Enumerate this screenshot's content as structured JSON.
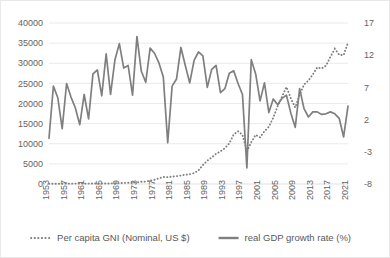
{
  "chart_data": {
    "type": "line",
    "title": "",
    "xlabel": "",
    "grid": true,
    "legend_position": "bottom",
    "x": [
      1953,
      1954,
      1955,
      1956,
      1957,
      1958,
      1959,
      1960,
      1961,
      1962,
      1963,
      1964,
      1965,
      1966,
      1967,
      1968,
      1969,
      1970,
      1971,
      1972,
      1973,
      1974,
      1975,
      1976,
      1977,
      1978,
      1979,
      1980,
      1981,
      1982,
      1983,
      1984,
      1985,
      1986,
      1987,
      1988,
      1989,
      1990,
      1991,
      1992,
      1993,
      1994,
      1995,
      1996,
      1997,
      1998,
      1999,
      2000,
      2001,
      2002,
      2003,
      2004,
      2005,
      2006,
      2007,
      2008,
      2009,
      2010,
      2011,
      2012,
      2013,
      2014,
      2015,
      2016,
      2017,
      2018,
      2019,
      2020,
      2021
    ],
    "xtick_labels": [
      "1953",
      "1957",
      "1961",
      "1965",
      "1969",
      "1973",
      "1977",
      "1981",
      "1985",
      "1989",
      "1993",
      "1997",
      "2001",
      "2005",
      "2009",
      "2013",
      "2017",
      "2021"
    ],
    "xtick_step_years": 4,
    "axes": {
      "left": {
        "label": "Per capita GNI (Nominal, US $)",
        "ylim": [
          0,
          40000
        ],
        "ticks": [
          0,
          5000,
          10000,
          15000,
          20000,
          25000,
          30000,
          35000,
          40000
        ],
        "tick_labels": [
          "0",
          "5000",
          "10000",
          "15000",
          "20000",
          "25000",
          "30000",
          "35000",
          "40000"
        ]
      },
      "right": {
        "label": "real GDP growth rate (%)",
        "ylim": [
          -8,
          17
        ],
        "ticks": [
          -8,
          -3,
          2,
          7,
          12,
          17
        ],
        "tick_labels": [
          "-8",
          "-3",
          "2",
          "7",
          "12",
          "17"
        ]
      }
    },
    "series": [
      {
        "name": "Per capita GNI (Nominal, US $)",
        "axis": "left",
        "style": "dotted",
        "color": "#7f7f7f",
        "values": [
          70,
          70,
          80,
          80,
          90,
          90,
          100,
          100,
          90,
          100,
          110,
          120,
          110,
          130,
          150,
          180,
          220,
          270,
          300,
          330,
          410,
          560,
          610,
          830,
          1050,
          1400,
          1750,
          1700,
          1830,
          1940,
          2110,
          2300,
          2430,
          2700,
          3400,
          4700,
          5800,
          6600,
          7500,
          8100,
          8900,
          10100,
          12300,
          13100,
          12200,
          8100,
          10400,
          12200,
          11600,
          13100,
          14200,
          16500,
          19300,
          21700,
          24100,
          21300,
          19000,
          22100,
          24700,
          25700,
          27200,
          29000,
          28700,
          29400,
          31600,
          33600,
          32100,
          32000,
          35100
        ]
      },
      {
        "name": "real GDP growth rate (%)",
        "axis": "right",
        "style": "solid",
        "color": "#7f7f7f",
        "values": [
          -0.9,
          7.2,
          5.4,
          0.6,
          7.6,
          5.5,
          3.8,
          1.2,
          5.9,
          2.1,
          9.1,
          9.7,
          5.7,
          12.2,
          5.9,
          11.3,
          13.8,
          10.0,
          10.4,
          5.8,
          14.9,
          9.5,
          7.8,
          13.1,
          12.3,
          10.8,
          8.6,
          -1.6,
          7.2,
          8.3,
          13.2,
          10.4,
          7.7,
          11.2,
          12.5,
          11.9,
          7.0,
          9.8,
          10.4,
          6.2,
          6.8,
          9.2,
          9.6,
          7.6,
          5.9,
          -5.5,
          11.3,
          9.1,
          4.9,
          7.7,
          3.1,
          5.2,
          4.3,
          5.3,
          5.8,
          3.0,
          0.8,
          6.8,
          3.7,
          2.4,
          3.2,
          3.2,
          2.8,
          2.9,
          3.2,
          2.9,
          2.2,
          -0.7,
          4.1
        ]
      }
    ],
    "legend": [
      {
        "name": "Per capita GNI (Nominal, US $)",
        "style": "dotted"
      },
      {
        "name": "real GDP growth rate (%)",
        "style": "solid"
      }
    ]
  }
}
